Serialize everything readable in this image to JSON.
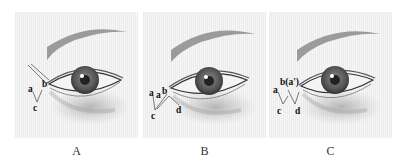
{
  "figure": {
    "panels": [
      {
        "id": "A",
        "caption": "A",
        "labels": {
          "a": "a",
          "b": "b",
          "c": "c"
        }
      },
      {
        "id": "B",
        "caption": "B",
        "labels": {
          "a1": "a",
          "a2": "a",
          "b": "b",
          "c": "c",
          "d": "d"
        }
      },
      {
        "id": "C",
        "caption": "C",
        "labels": {
          "a": "a",
          "b": "b(a')",
          "c": "c",
          "d": "d"
        }
      }
    ]
  }
}
